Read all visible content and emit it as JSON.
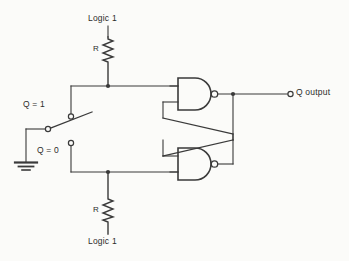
{
  "diagram": {
    "type": "schematic",
    "stroke_color": "#3a3a3a",
    "background_color": "#fbfbf9"
  },
  "labels": {
    "logic1_top": "Logic 1",
    "resistor_top": "R",
    "switch_position_high": "Q = 1",
    "switch_position_low": "Q = 0",
    "resistor_bottom": "R",
    "logic1_bottom": "Logic 1",
    "output": "Q output"
  },
  "components": {
    "resistor_top": {
      "name": "R",
      "supply": "Logic 1"
    },
    "resistor_bottom": {
      "name": "R",
      "supply": "Logic 1"
    },
    "nand_gate_top": {
      "type": "NAND",
      "inputs": 2
    },
    "nand_gate_bottom": {
      "type": "NAND",
      "inputs": 2
    },
    "switch": {
      "type": "SPDT",
      "contacts": [
        "Q = 1",
        "Q = 0"
      ]
    },
    "ground": {
      "type": "earth-ground"
    },
    "output_terminal": {
      "label": "Q output"
    }
  }
}
